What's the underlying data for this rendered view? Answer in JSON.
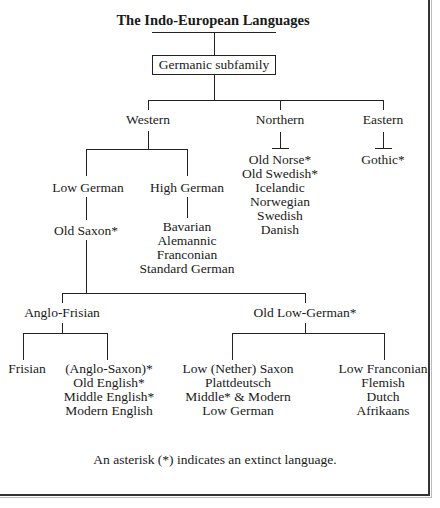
{
  "title": "The Indo-European Languages",
  "root": "Germanic subfamily",
  "branches": {
    "western": "Western",
    "northern": "Northern",
    "eastern": "Eastern"
  },
  "western": {
    "low_german": "Low German",
    "high_german": "High German",
    "old_saxon": "Old Saxon*",
    "high_german_languages": [
      "Bavarian",
      "Alemannic",
      "Franconian",
      "Standard German"
    ]
  },
  "northern_languages": [
    "Old Norse*",
    "Old Swedish*",
    "Icelandic",
    "Norwegian",
    "Swedish",
    "Danish"
  ],
  "eastern_languages": [
    "Gothic*"
  ],
  "old_saxon_children": {
    "anglo_frisian": "Anglo-Frisian",
    "old_low_german": "Old Low-German*"
  },
  "anglo_frisian_children": {
    "frisian": "Frisian",
    "english": [
      "(Anglo-Saxon)*",
      "Old English*",
      "Middle English*",
      "Modern English"
    ]
  },
  "old_low_german_children": {
    "low_saxon": [
      "Low (Nether) Saxon",
      "Plattdeutsch",
      "Middle* & Modern",
      "Low German"
    ],
    "low_franconian": [
      "Low Franconian",
      "Flemish",
      "Dutch",
      "Afrikaans"
    ]
  },
  "footnote": "An asterisk (*) indicates an extinct language."
}
